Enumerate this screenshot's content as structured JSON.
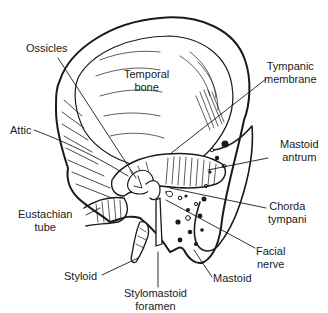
{
  "diagram": {
    "colors": {
      "ink": "#1a1a1a",
      "background": "#ffffff"
    },
    "labels": {
      "ossicles": {
        "lines": [
          "Ossicles"
        ]
      },
      "temporal_bone": {
        "lines": [
          "Temporal",
          "bone"
        ]
      },
      "tympanic_membrane": {
        "lines": [
          "Tympanic",
          "membrane"
        ]
      },
      "attic": {
        "lines": [
          "Attic"
        ]
      },
      "mastoid_antrum": {
        "lines": [
          "Mastoid",
          "antrum"
        ]
      },
      "chorda_tympani": {
        "lines": [
          "Chorda",
          "tympani"
        ]
      },
      "eustachian_tube": {
        "lines": [
          "Eustachian",
          "tube"
        ]
      },
      "facial_nerve": {
        "lines": [
          "Facial",
          "nerve"
        ]
      },
      "styloid": {
        "lines": [
          "Styloid"
        ]
      },
      "stylomastoid_foramen": {
        "lines": [
          "Stylomastoid",
          "foramen"
        ]
      },
      "mastoid": {
        "lines": [
          "Mastoid"
        ]
      }
    }
  }
}
